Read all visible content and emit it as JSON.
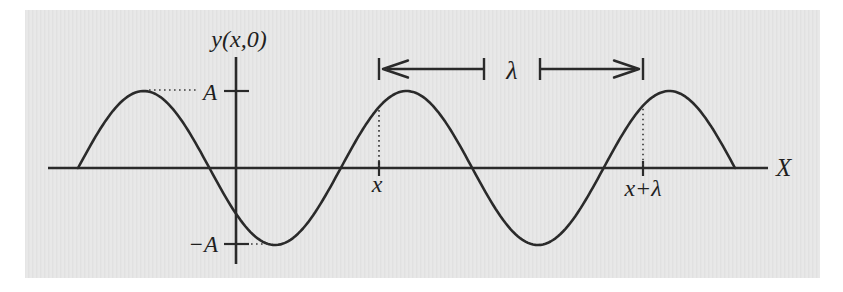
{
  "figure_type": "transverse-wave-snapshot-diagram",
  "labels": {
    "y_axis": "y(x,0)",
    "x_axis": "X",
    "amplitude_positive": "A",
    "amplitude_negative": "−A",
    "position_x": "x",
    "position_x_plus_lambda": "x+λ",
    "wavelength": "λ"
  },
  "colors": {
    "page": "#ffffff",
    "panel_background": "#e8e8e8",
    "panel_stripe": "#e1e1e1",
    "ink": "#2a2a2a"
  },
  "wave": {
    "shape": "sine",
    "amplitude_symbol": "A",
    "wavelength_symbol": "λ",
    "cycles_shown": 2.5,
    "starts_at": "zero crossing, rising",
    "marked_points": [
      "x",
      "x+λ"
    ],
    "geometry_px": {
      "baseline_y": 168,
      "amplitude": 77,
      "wavelength": 262.8,
      "start_x": 78,
      "x_mark": 379,
      "x_plus_lambda_mark": 643
    }
  }
}
